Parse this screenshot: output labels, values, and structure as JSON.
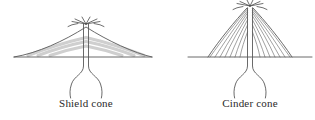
{
  "figure": {
    "title": "",
    "background_color": "#ffffff",
    "outline_color": "#595959",
    "layer_band_color": "#cfcfcf",
    "cinder_layer_color": "#6e6e6e",
    "label_color": "#2a2a2a"
  },
  "diagrams": [
    {
      "id": "shield-cone",
      "label": "Shield cone",
      "label_x": 86,
      "label_y": 107,
      "profile": "broad low-angle dome",
      "ground_y": 57,
      "summit_x": 86,
      "summit_y": 27,
      "base_left_x": 14,
      "base_right_x": 152,
      "layer_band_count": 3,
      "vent_spray_count": 6
    },
    {
      "id": "cinder-cone",
      "label": "Cinder cone",
      "label_x": 250,
      "label_y": 107,
      "profile": "steep narrow cone",
      "ground_y": 57,
      "summit_x": 250,
      "summit_y": 8,
      "base_left_x": 208,
      "base_right_x": 292,
      "ground_left_x": 188,
      "ground_right_x": 312,
      "cinder_layer_count": 7,
      "vent_spray_count": 6
    }
  ]
}
